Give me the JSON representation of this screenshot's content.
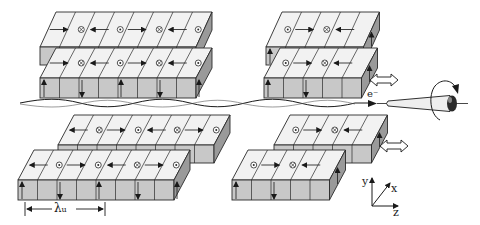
{
  "diagram": {
    "colors": {
      "top_face": "#f2f2f2",
      "front_face": "#c8c8c8",
      "side_face": "#9a9a9a",
      "line": "#2a2a2a"
    },
    "labels": {
      "electron": "e⁻",
      "lambda": "λ",
      "lambda_sub": "u",
      "axis_x": "x",
      "axis_y": "y",
      "axis_z": "z"
    },
    "blocks": [
      {
        "id": "upper-left-top",
        "x": 40,
        "y": 12,
        "n": 8,
        "w": 19.5,
        "dx": 16,
        "dy": 35,
        "h": 18,
        "top": [
          "r",
          "x",
          "l",
          "o",
          "r",
          "x",
          "l",
          "o"
        ],
        "front": []
      },
      {
        "id": "upper-left-bottom",
        "x": 40,
        "y": 48,
        "n": 8,
        "w": 19.5,
        "dx": 16,
        "dy": 30,
        "h": 20,
        "top": [
          "r",
          "x",
          "l",
          "o",
          "r",
          "x",
          "l",
          "o"
        ],
        "front": [
          "u",
          "",
          "d",
          "",
          "u",
          "",
          "d",
          "",
          "u"
        ]
      },
      {
        "id": "upper-right-top",
        "x": 266,
        "y": 12,
        "n": 5,
        "w": 19.5,
        "dx": 16,
        "dy": 35,
        "h": 18,
        "top": [
          "o",
          "r",
          "x",
          "l",
          ""
        ],
        "front": [
          "u"
        ],
        "side": "u"
      },
      {
        "id": "upper-right-bottom",
        "x": 264,
        "y": 48,
        "n": 5,
        "w": 19.5,
        "dx": 16,
        "dy": 30,
        "h": 20,
        "top": [
          "o",
          "r",
          "x",
          "l",
          ""
        ],
        "front": [
          "u",
          "",
          "d",
          ""
        ],
        "side": "u"
      },
      {
        "id": "lower-left-back",
        "x": 58,
        "y": 115,
        "n": 8,
        "w": 19.5,
        "dx": 16,
        "dy": 30,
        "h": 18,
        "top": [
          "l",
          "x",
          "r",
          "o",
          "l",
          "x",
          "r",
          "o"
        ],
        "front": []
      },
      {
        "id": "lower-left-front",
        "x": 18,
        "y": 150,
        "n": 8,
        "w": 19.5,
        "dx": 16,
        "dy": 30,
        "h": 20,
        "top": [
          "l",
          "o",
          "r",
          "o",
          "l",
          "x",
          "r",
          "o"
        ],
        "front": [
          "u",
          "",
          "d",
          "",
          "u",
          "",
          "d",
          "",
          "u"
        ]
      },
      {
        "id": "lower-right-back",
        "x": 274,
        "y": 115,
        "n": 5,
        "w": 19.5,
        "dx": 16,
        "dy": 30,
        "h": 18,
        "top": [
          "o",
          "r",
          "x",
          "l",
          ""
        ],
        "front": [],
        "side": "u"
      },
      {
        "id": "lower-right-front",
        "x": 232,
        "y": 150,
        "n": 5,
        "w": 19.5,
        "dx": 16,
        "dy": 30,
        "h": 20,
        "top": [
          "o",
          "r",
          "x",
          "l",
          ""
        ],
        "front": [
          "u",
          "",
          "d",
          "",
          ""
        ],
        "side": "u"
      }
    ],
    "arrows_double": [
      {
        "x": 370,
        "y": 80,
        "label": "gap-adjust-upper"
      },
      {
        "x": 380,
        "y": 146,
        "label": "gap-adjust-lower"
      }
    ],
    "wavelength_marker": {
      "x1": 25,
      "x2": 105,
      "y": 209
    }
  }
}
